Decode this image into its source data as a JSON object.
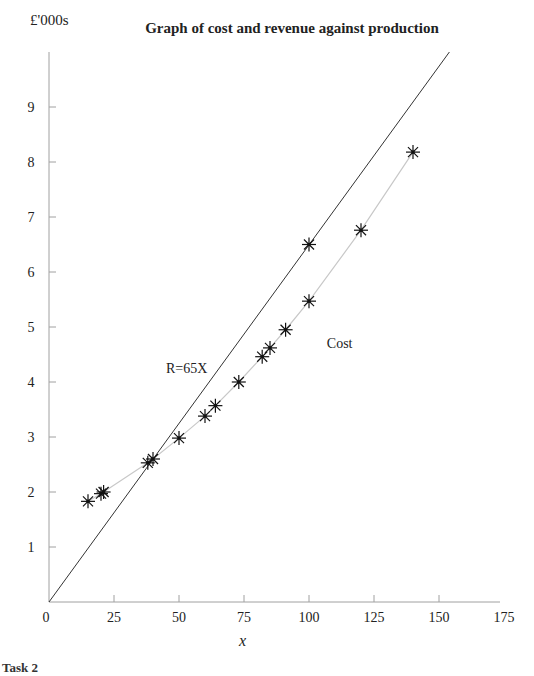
{
  "chart_data": {
    "type": "line",
    "title": "Graph of cost and revenue against production",
    "xlabel": "x",
    "ylabel": "£'000s",
    "xlim": [
      0,
      175
    ],
    "ylim": [
      0,
      10
    ],
    "x_ticks": [
      0,
      25,
      50,
      75,
      100,
      125,
      150,
      175
    ],
    "y_ticks": [
      1,
      2,
      3,
      4,
      5,
      6,
      7,
      8,
      9
    ],
    "grid": false,
    "legend": "none (inline annotations)",
    "series": [
      {
        "name": "Cost",
        "style": "light grey line with asterisk markers",
        "x": [
          15,
          20,
          21,
          38,
          40,
          50,
          60,
          64,
          73,
          82,
          85,
          91,
          100,
          120,
          140
        ],
        "y": [
          1.83,
          1.97,
          2.0,
          2.53,
          2.6,
          2.98,
          3.38,
          3.57,
          4.0,
          4.46,
          4.62,
          4.95,
          5.47,
          6.76,
          8.18
        ]
      },
      {
        "name": "R=65X",
        "style": "dark straight line",
        "equation": "R = 65X",
        "x": [
          0,
          154
        ],
        "y": [
          0,
          10.0
        ],
        "markers": [
          {
            "x": 100,
            "y": 6.5
          }
        ]
      }
    ],
    "annotations": [
      {
        "text": "Cost",
        "x": 103,
        "y": 4.8
      },
      {
        "text": "R=65X",
        "x": 45,
        "y": 4.2
      }
    ]
  },
  "labels": {
    "title": "Graph of cost and revenue against production",
    "ylabel": "£'000s",
    "xlabel": "x",
    "cost_annotation": "Cost",
    "revenue_annotation": "R=65X",
    "footer_cut": "Task 2"
  },
  "colors": {
    "axis": "#a0a0a0",
    "revenue_line": "#333333",
    "cost_line": "#c8c8c8",
    "marker": "#111111"
  }
}
